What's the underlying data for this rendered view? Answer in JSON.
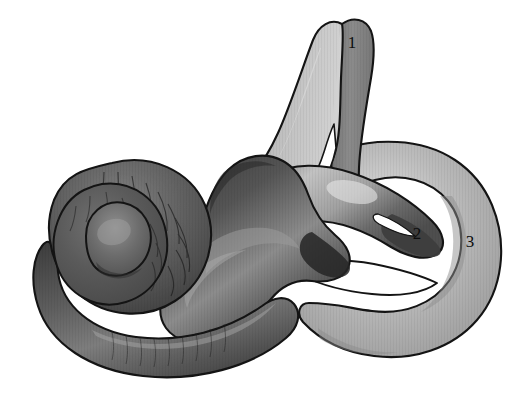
{
  "figure": {
    "background_color": "#ffffff",
    "width": 525,
    "height": 397,
    "style": "grayscale shaded anatomical line drawing",
    "outline_color": "#141414"
  },
  "labels": [
    {
      "id": "label-1",
      "text": "1",
      "x": 352,
      "y": 48,
      "refers_to": "superior (anterior) semicircular canal",
      "color": "#0d0d0d"
    },
    {
      "id": "label-2",
      "text": "2",
      "x": 417,
      "y": 239,
      "refers_to": "lateral (horizontal) semicircular canal",
      "color": "#0d0d0d"
    },
    {
      "id": "label-3",
      "text": "3",
      "x": 470,
      "y": 247,
      "refers_to": "posterior semicircular canal",
      "color": "#0d0d0d"
    }
  ],
  "structures": [
    {
      "name": "cochlea",
      "tone": "dark-gray",
      "fill": "#5d5d5d",
      "note": "spiral at left with radial striations"
    },
    {
      "name": "cochlear-basal-turn",
      "tone": "dark-gray",
      "fill": "#585858",
      "note": "lower left curving tail"
    },
    {
      "name": "vestibule",
      "tone": "darkest-gray",
      "fill": "#4a4a4a",
      "note": "central bulbous mass"
    },
    {
      "name": "superior-semicircular-canal",
      "tone": "mid-gray",
      "fill": "#8f8f8f",
      "note": "tall inverted V arch, label 1"
    },
    {
      "name": "lateral-semicircular-canal",
      "tone": "mid-dark-gray",
      "fill": "#6a6a6a",
      "note": "crossing loop, label 2"
    },
    {
      "name": "posterior-semicircular-canal",
      "tone": "light-gray",
      "fill": "#b4b4b4",
      "note": "large right-hand ring, label 3"
    }
  ],
  "palette": {
    "white": "#ffffff",
    "light_gray": "#b6b6b6",
    "mid_gray": "#909090",
    "dark_gray": "#5c5c5c",
    "darkest_gray": "#3a3a3a",
    "outline": "#141414"
  }
}
